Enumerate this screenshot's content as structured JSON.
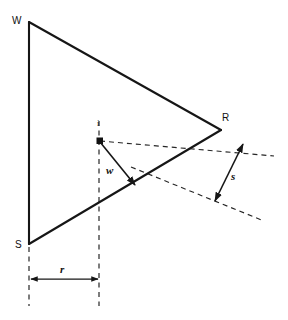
{
  "figure": {
    "type": "geometry-diagram",
    "background_color": "#ffffff",
    "line_color": "#161616",
    "dash_color": "#262626"
  },
  "vertices": [
    {
      "id": "W",
      "label": "W",
      "x": 29,
      "y": 22,
      "label_x": 12,
      "label_y": 16
    },
    {
      "id": "R",
      "label": "R",
      "x": 221,
      "y": 130,
      "label_x": 222,
      "label_y": 113
    },
    {
      "id": "S",
      "label": "S",
      "x": 29,
      "y": 244,
      "label_x": 15,
      "label_y": 240
    }
  ],
  "points": [
    {
      "id": "i",
      "label": "i",
      "x": 100,
      "y": 141,
      "label_x": 97,
      "label_y": 119
    }
  ],
  "measures": [
    {
      "id": "w",
      "label": "w",
      "label_x": 106,
      "label_y": 165,
      "from_x": 100,
      "from_y": 141,
      "to_x": 135,
      "to_y": 185,
      "arrow": "single"
    },
    {
      "id": "s",
      "label": "s",
      "label_x": 231,
      "label_y": 171,
      "from_x": 215,
      "from_y": 201,
      "to_x": 243,
      "to_y": 144,
      "arrow": "double"
    },
    {
      "id": "r",
      "label": "r",
      "label_x": 60,
      "label_y": 264,
      "from_x": 30,
      "from_y": 279,
      "to_x": 99,
      "to_y": 279,
      "arrow": "double"
    }
  ],
  "edges": [
    {
      "id": "W-S",
      "from": "W",
      "to": "S",
      "style": "solid"
    },
    {
      "id": "W-R",
      "from": "W",
      "to": "R",
      "style": "solid"
    },
    {
      "id": "R-S",
      "from": "R",
      "to": "S",
      "style": "solid"
    }
  ],
  "guides": [
    {
      "id": "upper-dashed",
      "x1": 100,
      "y1": 141,
      "x2": 274,
      "y2": 156,
      "style": "dashed"
    },
    {
      "id": "lower-dashed",
      "x1": 131,
      "y1": 167,
      "x2": 264,
      "y2": 221,
      "style": "dashed"
    },
    {
      "id": "left-vertical-dashed",
      "x1": 29,
      "y1": 247,
      "x2": 29,
      "y2": 306,
      "style": "dashed"
    },
    {
      "id": "right-vertical-dashed",
      "x1": 99,
      "y1": 121,
      "x2": 99,
      "y2": 306,
      "style": "dashed"
    }
  ],
  "labels": {
    "vertex_w": "W",
    "vertex_r": "R",
    "vertex_s": "S",
    "point_i": "i",
    "measure_w": "w",
    "measure_s": "s",
    "measure_r": "r"
  }
}
